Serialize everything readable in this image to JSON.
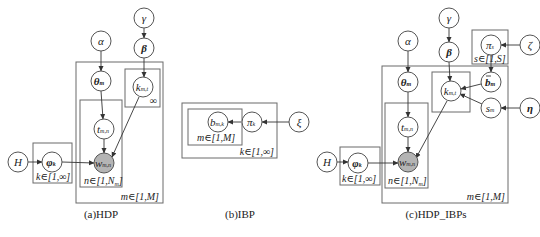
{
  "panels": [
    {
      "id": "hdp",
      "caption": "(a)HDP",
      "nodes": [
        {
          "id": "alpha",
          "label": "α"
        },
        {
          "id": "gamma",
          "label": "γ"
        },
        {
          "id": "beta",
          "label": "β"
        },
        {
          "id": "theta",
          "label": "θ",
          "sub": "m"
        },
        {
          "id": "k",
          "label": "k",
          "sub": "m,t"
        },
        {
          "id": "t",
          "label": "t",
          "sub": "m,n"
        },
        {
          "id": "w",
          "label": "w",
          "sub": "m,n",
          "observed": true
        },
        {
          "id": "phi",
          "label": "φ",
          "sub": "k"
        },
        {
          "id": "H",
          "label": "H"
        }
      ],
      "plates": [
        {
          "id": "m",
          "label": "m∈[1,M]"
        },
        {
          "id": "k",
          "label": "∞"
        },
        {
          "id": "n",
          "label": "n∈[1,N",
          "label_sub": "m",
          "label_end": "]"
        },
        {
          "id": "phi",
          "label": "k∈[1,∞]"
        }
      ]
    },
    {
      "id": "ibp",
      "caption": "(b)IBP",
      "nodes": [
        {
          "id": "b",
          "label": "b",
          "sub": "m,k"
        },
        {
          "id": "pi",
          "label": "π",
          "sub": "k"
        },
        {
          "id": "xi",
          "label": "ξ"
        }
      ],
      "plates": [
        {
          "id": "m",
          "label": "m∈[1,M]"
        },
        {
          "id": "k",
          "label": "k∈[1,∞]"
        }
      ]
    },
    {
      "id": "hdp_ibps",
      "caption": "(c)HDP_IBPs",
      "nodes": [
        {
          "id": "H",
          "label": "H"
        },
        {
          "id": "phi",
          "label": "φ",
          "sub": "k"
        },
        {
          "id": "alpha",
          "label": "α"
        },
        {
          "id": "theta",
          "label": "θ",
          "sub": "m"
        },
        {
          "id": "t",
          "label": "t",
          "sub": "m,n"
        },
        {
          "id": "w",
          "label": "w",
          "sub": "m,n",
          "observed": true
        },
        {
          "id": "gamma",
          "label": "γ"
        },
        {
          "id": "beta",
          "label": "β"
        },
        {
          "id": "k",
          "label": "k",
          "sub": "m,t"
        },
        {
          "id": "pi",
          "label": "π",
          "sub": "s"
        },
        {
          "id": "zeta",
          "label": "ζ"
        },
        {
          "id": "b",
          "label": "b",
          "sub": "m",
          "bar": true
        },
        {
          "id": "s",
          "label": "s",
          "sub": "m"
        },
        {
          "id": "eta",
          "label": "η"
        }
      ],
      "plates": [
        {
          "id": "phi",
          "label": "k∈[1,∞]"
        },
        {
          "id": "n",
          "label": "n∈[1,N",
          "label_sub": "m",
          "label_end": "]"
        },
        {
          "id": "m",
          "label": "m∈[1,M]"
        },
        {
          "id": "s",
          "label": "s∈[1,S]"
        }
      ]
    }
  ]
}
